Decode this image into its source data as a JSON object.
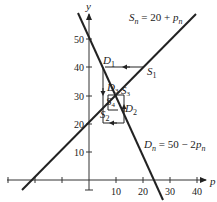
{
  "figure": {
    "axes": {
      "x_label": "p",
      "y_label": "y",
      "x_ticks": [
        "10",
        "20",
        "30",
        "40"
      ],
      "y_ticks": [
        "10",
        "20",
        "30",
        "40",
        "50"
      ]
    },
    "supply_equation": {
      "lhs": "S",
      "sub": "n",
      "rhs": " = 20 + ",
      "var": "p",
      "var_sub": "n"
    },
    "demand_equation": {
      "lhs": "D",
      "sub": "n",
      "rhs": " = 50 − 2",
      "var": "p",
      "var_sub": "n"
    },
    "points": [
      {
        "name": "D",
        "sub": "1"
      },
      {
        "name": "S",
        "sub": "1"
      },
      {
        "name": "D",
        "sub": "2"
      },
      {
        "name": "S",
        "sub": "2"
      },
      {
        "name": "D",
        "sub": "3"
      },
      {
        "name": "S",
        "sub": "3"
      },
      {
        "name": "S",
        "sub": "4"
      }
    ]
  }
}
